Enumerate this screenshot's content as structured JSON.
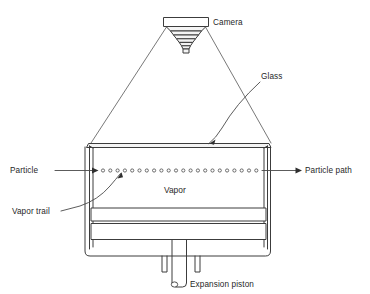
{
  "figure": {
    "background_color": "#ffffff",
    "line_color": "#3c3c3c",
    "text_color": "#1f1f1f"
  },
  "labels": {
    "camera": "Camera",
    "glass": "Glass",
    "particle": "Particle",
    "particle_path": "Particle path",
    "vapor": "Vapor",
    "vapor_trail": "Vapor trail",
    "expansion_piston": "Expansion piston"
  },
  "parts": {
    "camera": {
      "name": "camera",
      "body_label": "camera-body",
      "lens_label": "camera-lens-cone",
      "lens_step_count": 7
    },
    "sight_lines": {
      "name": "camera-field-of-view",
      "count": 2
    },
    "chamber": {
      "name": "cloud-chamber",
      "top_glass": "glass-top-plate",
      "left_wall": "glass-left-wall",
      "right_wall": "glass-right-wall",
      "interior": "vapor-volume",
      "plate_upper": "piston-plate-upper",
      "plate_lower": "piston-plate-lower"
    },
    "particle_track": {
      "name": "vapor-droplet-track",
      "droplet_count": 22,
      "droplet_radius": 1.6
    },
    "piston": {
      "name": "expansion-piston-rod",
      "flange_left": "piston-flange-left",
      "flange_right": "piston-flange-right"
    }
  }
}
